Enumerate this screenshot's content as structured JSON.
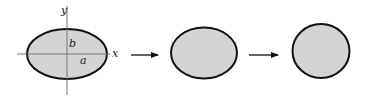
{
  "diagram": {
    "colors": {
      "fill": "#d4d4d4",
      "stroke": "#111111",
      "axis": "#777777",
      "arrow": "#111111"
    },
    "axes": {
      "x_label": "x",
      "y_label": "y"
    },
    "shapes": [
      {
        "id": "ellipse-1",
        "cx": 67,
        "cy": 54,
        "rx": 40,
        "ry": 25,
        "labels": {
          "semi_major": "a",
          "semi_minor": "b"
        }
      },
      {
        "id": "ellipse-2",
        "cx": 204,
        "cy": 53,
        "rx": 33,
        "ry": 25.5
      },
      {
        "id": "circle-3",
        "cx": 321,
        "cy": 51,
        "rx": 28.5,
        "ry": 27
      }
    ],
    "arrows": [
      {
        "id": "arrow-1",
        "x1": 131,
        "x2": 158,
        "y": 55
      },
      {
        "id": "arrow-2",
        "x1": 249,
        "x2": 278,
        "y": 55
      }
    ]
  }
}
